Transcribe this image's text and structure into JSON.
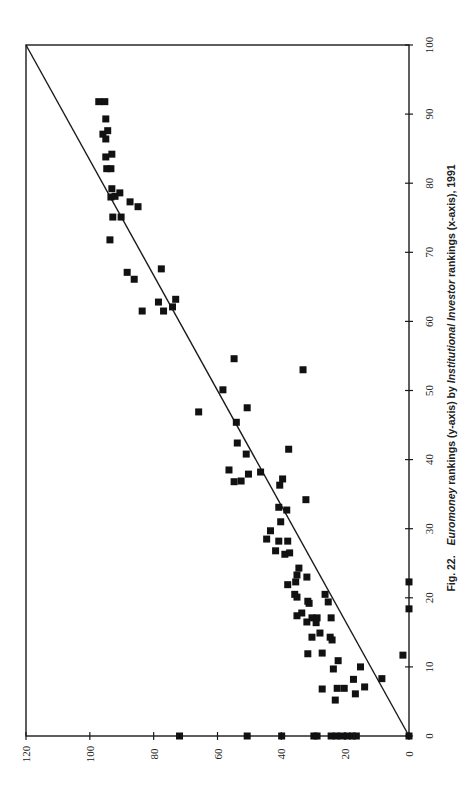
{
  "caption": {
    "figure_label": "Fig. 22.",
    "part1_italic": "Euromoney",
    "part2": " rankings (y-axis) by ",
    "part3_italic": "Institutional Investor",
    "part4": " rankings (x-axis), 1991"
  },
  "chart_data": {
    "type": "scatter",
    "xlabel": "Institutional Investor rankings",
    "ylabel": "Euromoney rankings",
    "orientation": "rotated 90° counter-clockwise on page (x-axis runs up along right edge, y-axis runs left along bottom)",
    "xlim": [
      0,
      100
    ],
    "ylim": [
      0,
      120
    ],
    "x_ticks": [
      0,
      10,
      20,
      30,
      40,
      50,
      60,
      70,
      80,
      90,
      100
    ],
    "y_ticks": [
      0,
      20,
      40,
      60,
      80,
      100,
      120
    ],
    "grid": false,
    "legend": null,
    "marker": "filled square",
    "reference_line": {
      "from": [
        0,
        0
      ],
      "to": [
        100,
        120
      ],
      "label": ""
    },
    "points": [
      [
        91.8,
        97.2
      ],
      [
        91.8,
        95.3
      ],
      [
        89.3,
        95.0
      ],
      [
        87.1,
        95.9
      ],
      [
        87.6,
        94.4
      ],
      [
        86.4,
        95.0
      ],
      [
        83.8,
        95.0
      ],
      [
        84.2,
        93.1
      ],
      [
        82.1,
        94.7
      ],
      [
        82.1,
        93.4
      ],
      [
        79.2,
        93.1
      ],
      [
        78.0,
        93.4
      ],
      [
        78.1,
        92.1
      ],
      [
        78.6,
        90.6
      ],
      [
        77.3,
        87.4
      ],
      [
        76.6,
        84.9
      ],
      [
        75.1,
        92.8
      ],
      [
        75.1,
        90.2
      ],
      [
        71.8,
        93.7
      ],
      [
        67.1,
        88.3
      ],
      [
        66.1,
        86.1
      ],
      [
        67.6,
        77.6
      ],
      [
        62.8,
        78.5
      ],
      [
        63.2,
        73.1
      ],
      [
        61.5,
        83.6
      ],
      [
        61.5,
        76.9
      ],
      [
        62.1,
        74.1
      ],
      [
        54.6,
        54.8
      ],
      [
        53.0,
        33.2
      ],
      [
        50.1,
        58.3
      ],
      [
        46.9,
        65.9
      ],
      [
        47.5,
        50.7
      ],
      [
        45.4,
        54.1
      ],
      [
        42.4,
        53.8
      ],
      [
        40.8,
        51.0
      ],
      [
        41.5,
        37.7
      ],
      [
        38.5,
        56.4
      ],
      [
        36.8,
        54.8
      ],
      [
        36.9,
        52.6
      ],
      [
        37.9,
        50.3
      ],
      [
        38.2,
        46.5
      ],
      [
        37.2,
        39.6
      ],
      [
        36.3,
        40.5
      ],
      [
        34.2,
        32.3
      ],
      [
        33.1,
        40.8
      ],
      [
        32.7,
        38.3
      ],
      [
        31.0,
        40.2
      ],
      [
        29.7,
        43.4
      ],
      [
        28.5,
        44.6
      ],
      [
        28.2,
        40.8
      ],
      [
        28.2,
        38.0
      ],
      [
        26.8,
        41.8
      ],
      [
        26.3,
        38.9
      ],
      [
        26.5,
        37.4
      ],
      [
        24.3,
        34.5
      ],
      [
        23.3,
        35.1
      ],
      [
        23.0,
        32.0
      ],
      [
        22.3,
        35.5
      ],
      [
        21.9,
        38.0
      ],
      [
        20.5,
        35.8
      ],
      [
        20.1,
        35.1
      ],
      [
        19.5,
        31.7
      ],
      [
        19.2,
        31.3
      ],
      [
        20.5,
        26.3
      ],
      [
        19.4,
        25.3
      ],
      [
        17.4,
        35.1
      ],
      [
        17.8,
        33.6
      ],
      [
        16.5,
        32.0
      ],
      [
        17.1,
        30.4
      ],
      [
        17.1,
        28.8
      ],
      [
        16.4,
        29.1
      ],
      [
        17.1,
        24.4
      ],
      [
        14.3,
        30.4
      ],
      [
        14.9,
        27.9
      ],
      [
        14.3,
        24.7
      ],
      [
        13.9,
        24.1
      ],
      [
        11.9,
        31.7
      ],
      [
        12.0,
        27.2
      ],
      [
        10.9,
        22.2
      ],
      [
        9.7,
        23.7
      ],
      [
        10.0,
        15.2
      ],
      [
        8.2,
        17.4
      ],
      [
        7.1,
        13.9
      ],
      [
        6.8,
        27.2
      ],
      [
        6.9,
        22.5
      ],
      [
        6.9,
        20.3
      ],
      [
        6.1,
        16.8
      ],
      [
        5.2,
        23.1
      ],
      [
        8.3,
        8.5
      ],
      [
        11.7,
        1.9
      ],
      [
        22.3,
        0
      ],
      [
        18.4,
        0
      ],
      [
        0,
        0
      ],
      [
        0,
        71.9
      ],
      [
        0,
        50.7
      ],
      [
        0,
        39.9
      ],
      [
        0,
        29.8
      ],
      [
        0,
        28.8
      ],
      [
        0,
        24.4
      ],
      [
        0,
        22.8
      ],
      [
        0,
        21.2
      ],
      [
        0,
        19.3
      ],
      [
        0,
        17.7
      ],
      [
        0,
        16.5
      ]
    ]
  }
}
